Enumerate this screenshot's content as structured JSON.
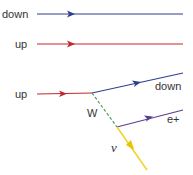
{
  "diagram": {
    "type": "feynman",
    "colors": {
      "down": "#2f3f8f",
      "up": "#c1272d",
      "w_boson": "#3f9a4a",
      "positron": "#5a3f8f",
      "neutrino": "#f2d21b",
      "label": "#333333"
    },
    "particles": {
      "spectator_down": {
        "label": "down"
      },
      "spectator_up": {
        "label": "up"
      },
      "incoming_up": {
        "label": "up"
      },
      "outgoing_down": {
        "label": "down"
      },
      "w_boson": {
        "label": "W"
      },
      "positron": {
        "label": "e+"
      },
      "neutrino": {
        "label": "ν"
      }
    }
  }
}
